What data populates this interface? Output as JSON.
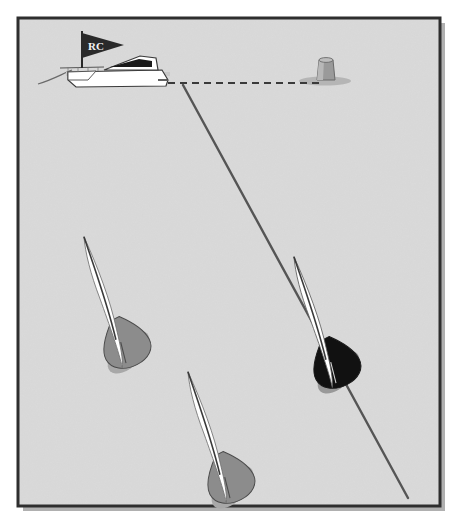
{
  "illustration": {
    "title": "Sailing race start line diagram",
    "subject": "Three dinghies approaching the starting line between a race committee boat and a pin mark",
    "background_color": "#d9d9d9",
    "paper_color": "#ffffff",
    "frame": {
      "name": "diagram-border",
      "stroke_color": "#2e2e2e",
      "fill_color": "#d9d9d9",
      "shadow_color": "#b0b0b0",
      "x": 18,
      "y": 18,
      "width": 422,
      "height": 488,
      "stroke_width": 3
    },
    "committee_boat": {
      "name": "race-committee-boat",
      "label": "Race Committee Boat",
      "hull_color": "#ffffff",
      "outline_color": "#3a3a3a",
      "cabin_window_color": "#1a1a1a",
      "deck_shadow_color": "#c9c9c9",
      "x": 40,
      "y": 55
    },
    "committee_flag": {
      "name": "race-committee-flag",
      "text": "RC",
      "flag_color": "#2a2a2a",
      "text_color": "#f2f2f2",
      "pole_color": "#2a2a2a",
      "shape": "pennant"
    },
    "pin_mark": {
      "name": "pin-end-mark-buoy",
      "label": "Pin End Mark",
      "body_color": "#9a9a9a",
      "top_color": "#bdbdbd",
      "shadow_color": "#b5b5b5",
      "outline_color": "#6a6a6a",
      "x": 318,
      "y": 58
    },
    "start_line": {
      "name": "start-line",
      "label": "Starting Line",
      "style": "dashed",
      "color": "#3a3a3a",
      "stroke_width": 2,
      "dash_pattern": "7 5",
      "x1": 168,
      "y1": 83,
      "x2": 322,
      "y2": 83
    },
    "course_line": {
      "name": "course-layline",
      "label": "Layline to first mark",
      "style": "solid",
      "color": "#555555",
      "stroke_width": 2.4,
      "x1": 183,
      "y1": 85,
      "x2": 408,
      "y2": 498
    },
    "wake_line": {
      "name": "stern-wake-line",
      "color": "#6a6a6a",
      "stroke_width": 1.2
    },
    "boats": [
      {
        "name": "sailboat-port-gray",
        "id": "boat-1",
        "hull_color": "#8c8c8c",
        "hull_shadow_color": "#a8a8a8",
        "sail_color": "#ffffff",
        "outline_color": "#4a4a4a",
        "mast_color": "#3a3a3a",
        "position": "lower-left",
        "x": 88,
        "y": 285,
        "rotation": -28
      },
      {
        "name": "sailboat-lead-black",
        "id": "boat-2",
        "hull_color": "#111111",
        "hull_shadow_color": "#999999",
        "sail_color": "#ffffff",
        "outline_color": "#1a1a1a",
        "mast_color": "#3a3a3a",
        "position": "center-right",
        "x": 298,
        "y": 305,
        "rotation": -28
      },
      {
        "name": "sailboat-trailing-gray",
        "id": "boat-3",
        "hull_color": "#8c8c8c",
        "hull_shadow_color": "#a8a8a8",
        "sail_color": "#ffffff",
        "outline_color": "#4a4a4a",
        "mast_color": "#3a3a3a",
        "position": "bottom-center",
        "x": 192,
        "y": 420,
        "rotation": -28
      }
    ]
  }
}
